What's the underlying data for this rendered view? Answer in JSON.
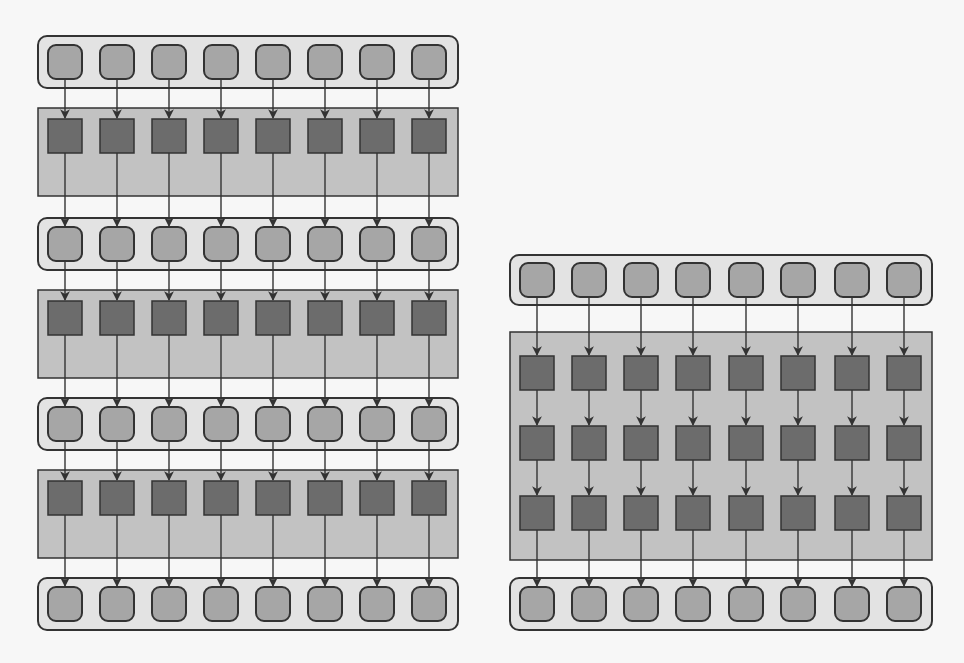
{
  "figure": {
    "caption_fragment": "",
    "colors": {
      "background": "#f7f7f7",
      "row_container_fill": "#e3e3e3",
      "row_node_fill": "#a6a6a6",
      "layer_block_fill": "#c2c2c2",
      "layer_node_fill": "#6c6c6c",
      "stroke": "#333333"
    }
  },
  "left_diagram": {
    "description": "Stacked architecture: input row, layer, row, layer, row, layer, output row",
    "x": 38,
    "width": 420,
    "node_centers_x": [
      65,
      117,
      169,
      221,
      273,
      325,
      377,
      429
    ],
    "rows": [
      {
        "y": 36,
        "h": 52
      },
      {
        "y": 218,
        "h": 52
      },
      {
        "y": 398,
        "h": 52
      },
      {
        "y": 578,
        "h": 52
      }
    ],
    "layers": [
      {
        "y": 108,
        "h": 88,
        "node_rows_y": [
          136
        ]
      },
      {
        "y": 290,
        "h": 88,
        "node_rows_y": [
          318
        ]
      },
      {
        "y": 470,
        "h": 88,
        "node_rows_y": [
          498
        ]
      }
    ]
  },
  "right_diagram": {
    "description": "Input row, one block containing three stacked layers, output row",
    "x": 510,
    "width": 422,
    "node_centers_x": [
      537,
      589,
      641,
      693,
      746,
      798,
      852,
      904
    ],
    "rows": [
      {
        "y": 255,
        "h": 50
      },
      {
        "y": 578,
        "h": 52
      }
    ],
    "layers": [
      {
        "y": 332,
        "h": 228,
        "node_rows_y": [
          373,
          443,
          513
        ]
      }
    ]
  }
}
